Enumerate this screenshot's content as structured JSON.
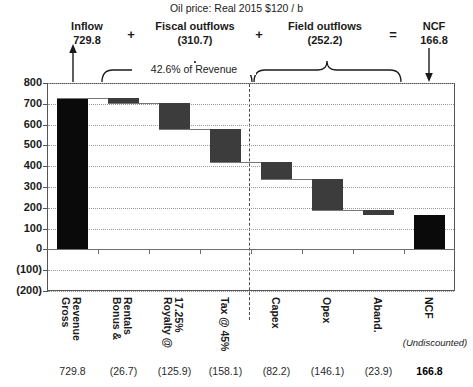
{
  "title": "Oil price: Real 2015 $120 / b",
  "header": {
    "groups": [
      {
        "name": "inflow",
        "label": "Inflow",
        "value": "729.8",
        "arrow": "up-arrow"
      },
      {
        "name": "fiscal",
        "label": "Fiscal outflows",
        "value": "(310.7)",
        "brace": "curly-brace"
      },
      {
        "name": "field",
        "label": "Field outflows",
        "value": "(252.2)",
        "brace": "curly-brace"
      },
      {
        "name": "ncf",
        "label": "NCF",
        "value": "166.8",
        "arrow": "down-arrow"
      }
    ],
    "operators": [
      "+",
      "+",
      "="
    ],
    "brace_note": "42.6% of Revenue"
  },
  "axis": {
    "yticks": [
      "800",
      "700",
      "600",
      "500",
      "400",
      "300",
      "200",
      "100",
      "0",
      "(100)",
      "(200)"
    ],
    "yvalues": [
      800,
      700,
      600,
      500,
      400,
      300,
      200,
      100,
      0,
      -100,
      -200
    ]
  },
  "footer": {
    "ncf_note": "(Undiscounted)"
  },
  "colors": {
    "total_bar": "#0a0a0a",
    "step_bar": "#3c3c3c",
    "grid": "#9a9a9a",
    "axis": "#555555"
  },
  "chart_data": {
    "type": "bar",
    "chart_style": "waterfall",
    "title": "Oil price: Real 2015 $120 / b",
    "xlabel": "",
    "ylabel": "",
    "ylim": [
      -200,
      800
    ],
    "ytick_step": 100,
    "grid": true,
    "legend": "none",
    "categories": [
      "Gross Revenue",
      "Bonus & Rentals",
      "Royalty @ 17.25%",
      "Tax @ 45%",
      "Capex",
      "Opex",
      "Aband.",
      "NCF"
    ],
    "category_lines": [
      [
        "Gross",
        "Revenue"
      ],
      [
        "Bonus &",
        "Rentals"
      ],
      [
        "Royalty @",
        "17.25%"
      ],
      [
        "Tax @ 45%"
      ],
      [
        "Capex"
      ],
      [
        "Opex"
      ],
      [
        "Aband."
      ],
      [
        "NCF"
      ]
    ],
    "value_labels": [
      "729.8",
      "(26.7)",
      "(125.9)",
      "(158.1)",
      "(82.2)",
      "(146.1)",
      "(23.9)",
      "166.8"
    ],
    "values": [
      729.8,
      -26.7,
      -125.9,
      -158.1,
      -82.2,
      -146.1,
      -23.9,
      166.8
    ],
    "kinds": [
      "total",
      "delta",
      "delta",
      "delta",
      "delta",
      "delta",
      "delta",
      "total"
    ],
    "bar_start": [
      0,
      729.8,
      703.1,
      577.2,
      419.1,
      336.9,
      190.8,
      0
    ],
    "bar_end": [
      729.8,
      703.1,
      577.2,
      419.1,
      336.9,
      190.8,
      166.8,
      166.8
    ],
    "cumulative": [
      729.8,
      703.1,
      577.2,
      419.1,
      336.9,
      190.8,
      166.8,
      166.8
    ],
    "annotations": [
      {
        "text": "Inflow 729.8",
        "covers": [
          "Gross Revenue"
        ]
      },
      {
        "text": "Fiscal outflows (310.7)",
        "covers": [
          "Bonus & Rentals",
          "Royalty @ 17.25%",
          "Tax @ 45%"
        ]
      },
      {
        "text": "42.6% of Revenue",
        "covers": [
          "Bonus & Rentals",
          "Royalty @ 17.25%",
          "Tax @ 45%"
        ]
      },
      {
        "text": "Field outflows (252.2)",
        "covers": [
          "Capex",
          "Opex",
          "Aband."
        ]
      },
      {
        "text": "NCF 166.8",
        "covers": [
          "NCF"
        ]
      },
      {
        "text": "(Undiscounted)",
        "covers": [
          "NCF"
        ]
      }
    ],
    "divider_after_category": "Tax @ 45%"
  }
}
